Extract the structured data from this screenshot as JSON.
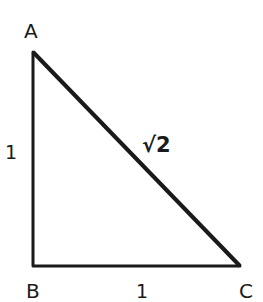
{
  "diagram": {
    "type": "right-triangle",
    "vertices": [
      {
        "label": "A",
        "x": 33,
        "y": 52
      },
      {
        "label": "B",
        "x": 33,
        "y": 266
      },
      {
        "label": "C",
        "x": 240,
        "y": 266
      }
    ],
    "sides": {
      "AB": "1",
      "BC": "1",
      "AC": "√2"
    },
    "stroke_color": "#1a1a1a"
  }
}
